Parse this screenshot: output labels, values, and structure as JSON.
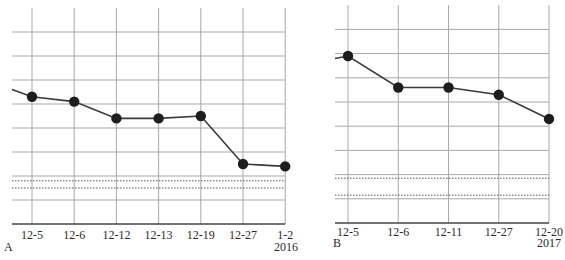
{
  "chart_data": [
    {
      "type": "line",
      "panel_label": "A",
      "title": "",
      "xlabel": "",
      "ylabel": "",
      "year_label": "2016",
      "categories": [
        "12-5",
        "12-6",
        "12-12",
        "12-13",
        "12-19",
        "12-27",
        "1-2"
      ],
      "values": [
        5.3,
        5.1,
        4.4,
        4.4,
        4.5,
        2.5,
        2.4
      ],
      "lead_in_value": 5.6,
      "ylim": [
        0,
        9
      ],
      "y_unit": "gridline units (no numeric y tick labels shown)",
      "major_gridlines": [
        1,
        2,
        3,
        4,
        5,
        6,
        7,
        8
      ],
      "dotted_reference_lines": [
        1.8,
        1.5
      ],
      "grid": true,
      "legend": "none"
    },
    {
      "type": "line",
      "panel_label": "B",
      "title": "",
      "xlabel": "",
      "ylabel": "",
      "year_label": "2017",
      "categories": [
        "12-5",
        "12-6",
        "12-11",
        "12-27",
        "12-20"
      ],
      "values": [
        6.9,
        5.6,
        5.6,
        5.3,
        4.3
      ],
      "lead_in_value": 6.8,
      "ylim": [
        0,
        9
      ],
      "y_unit": "gridline units (no numeric y tick labels shown)",
      "major_gridlines": [
        1,
        2,
        3,
        4,
        5,
        6,
        7,
        8
      ],
      "dotted_reference_lines": [
        1.85,
        1.15
      ],
      "grid": true,
      "legend": "none"
    }
  ],
  "colors": {
    "grid": "#a9a9a9",
    "axis": "#444444",
    "line": "#3a3a3a",
    "marker": "#1e1e1e",
    "text": "#2a2a2a"
  }
}
